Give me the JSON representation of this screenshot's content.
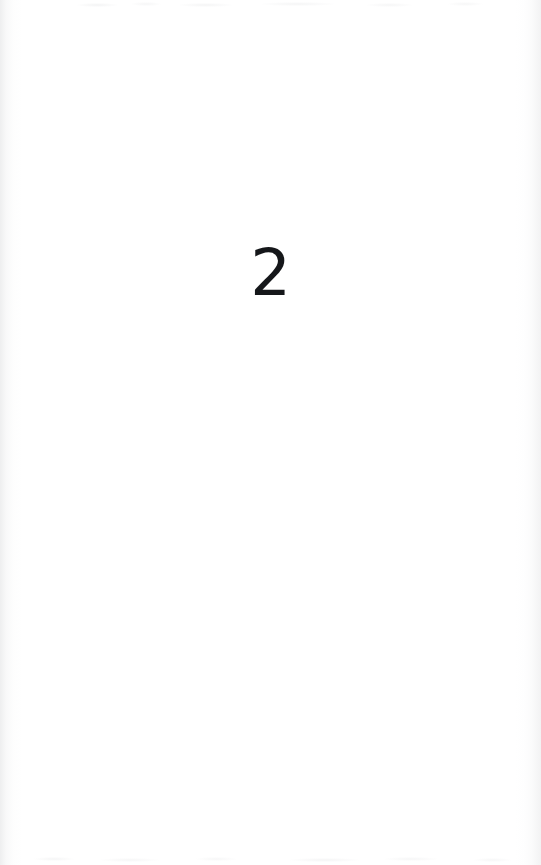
{
  "document": {
    "type": "scanned-book-page",
    "page_label": "2",
    "body_text": "",
    "background_color": "#ffffff",
    "ink_color": "#15171a"
  },
  "page": {
    "number": "2",
    "position": "center",
    "glyph_center_x": 276,
    "glyph_center_y": 273
  },
  "artifacts": {
    "left_edge_shadow": true,
    "right_edge_shadow": true,
    "top_bleed_through": true,
    "bottom_bleed_through": true
  }
}
